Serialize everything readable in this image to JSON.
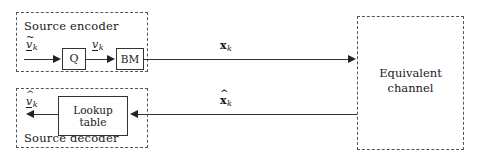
{
  "diagram": {
    "groups": {
      "encoder": {
        "caption": "Source encoder"
      },
      "decoder": {
        "caption": "Source decoder"
      },
      "channel": {
        "label": "Equivalent\nchannel"
      }
    },
    "blocks": {
      "quantizer": {
        "label": "Q"
      },
      "bit_mapper": {
        "label": "BM"
      },
      "lookup_table": {
        "label": "Lookup\ntable"
      }
    },
    "signals": {
      "encoder_input": {
        "base": "v",
        "accent": "~",
        "subscript": "k",
        "underline": true,
        "bold": false
      },
      "quantizer_out": {
        "base": "v",
        "accent": "",
        "subscript": "k",
        "underline": true,
        "bold": false
      },
      "decoder_output": {
        "base": "v",
        "accent": "^",
        "subscript": "k",
        "underline": true,
        "bold": false
      },
      "channel_input": {
        "base": "x",
        "accent": "",
        "subscript": "k",
        "underline": false,
        "bold": true
      },
      "channel_output": {
        "base": "x",
        "accent": "^",
        "subscript": "k",
        "underline": false,
        "bold": true
      }
    },
    "colors": {
      "background": "#ffffff",
      "line": "#333333",
      "dashed_border": "#555555",
      "text": "#1a1a1a"
    }
  }
}
